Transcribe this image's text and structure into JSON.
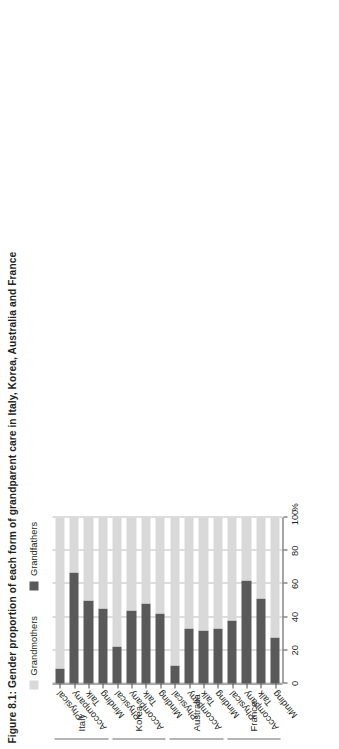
{
  "figure": {
    "title": "Figure 8.1: Gender proportion of each form of grandparent care in Italy, Korea, Australia and France",
    "axis_unit": "%"
  },
  "legend": {
    "items": [
      {
        "label": "Grandmothers",
        "color": "#d9d9d9"
      },
      {
        "label": "Grandfathers",
        "color": "#595959"
      }
    ]
  },
  "chart_data": {
    "type": "bar",
    "orientation": "horizontal-stacked",
    "title": "Figure 8.1: Gender proportion of each form of grandparent care in Italy, Korea, Australia and France",
    "xlabel": "%",
    "ylabel": "",
    "xlim": [
      0,
      100
    ],
    "xticks": [
      0,
      20,
      40,
      60,
      80,
      100
    ],
    "grid": true,
    "legend_position": "top-left",
    "stacked_to": 100,
    "series": [
      {
        "name": "Grandfathers",
        "color": "#595959",
        "values": [
          9,
          67,
          50,
          45,
          22,
          44,
          48,
          42,
          11,
          33,
          32,
          33,
          38,
          62,
          51,
          28
        ]
      },
      {
        "name": "Grandmothers",
        "color": "#d9d9d9",
        "values": [
          91,
          33,
          50,
          55,
          78,
          56,
          52,
          58,
          89,
          67,
          68,
          67,
          62,
          38,
          49,
          72
        ]
      }
    ],
    "categories": [
      "Physical",
      "Accompany",
      "Talk",
      "Minding",
      "Physical",
      "Accompany",
      "Talk",
      "Minding",
      "Physical",
      "Accompany",
      "Talk",
      "Minding",
      "Physical",
      "Accompany",
      "Talk",
      "Minding"
    ],
    "groups": [
      {
        "name": "Italy",
        "categories": [
          "Physical",
          "Accompany",
          "Talk",
          "Minding"
        ],
        "Grandfathers": [
          9,
          67,
          50,
          45
        ],
        "Grandmothers": [
          91,
          33,
          50,
          55
        ]
      },
      {
        "name": "Korea",
        "categories": [
          "Physical",
          "Accompany",
          "Talk",
          "Minding"
        ],
        "Grandfathers": [
          22,
          44,
          48,
          42
        ],
        "Grandmothers": [
          78,
          56,
          52,
          58
        ]
      },
      {
        "name": "Australia",
        "categories": [
          "Physical",
          "Accompany",
          "Talk",
          "Minding"
        ],
        "Grandfathers": [
          11,
          33,
          32,
          33
        ],
        "Grandmothers": [
          89,
          67,
          68,
          67
        ]
      },
      {
        "name": "France",
        "categories": [
          "Physical",
          "Accompany",
          "Talk",
          "Minding"
        ],
        "Grandfathers": [
          38,
          62,
          51,
          28
        ],
        "Grandmothers": [
          62,
          38,
          49,
          72
        ]
      }
    ]
  },
  "axis": {
    "tick_labels": [
      "0",
      "20",
      "40",
      "60",
      "80",
      "100"
    ]
  }
}
